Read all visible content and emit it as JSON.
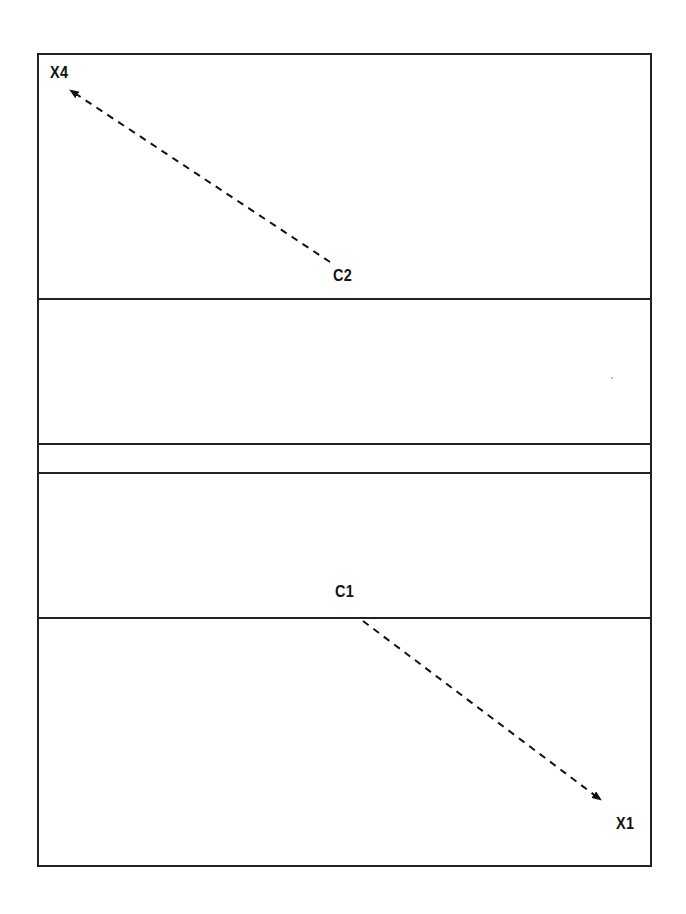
{
  "diagram": {
    "type": "field-layout",
    "colors": {
      "line": "#222222",
      "text": "#111111",
      "background": "#ffffff"
    },
    "zones": [
      {
        "id": "zone-top",
        "y_range": [
          53,
          299
        ]
      },
      {
        "id": "zone-upper-middle",
        "y_range": [
          299,
          444
        ]
      },
      {
        "id": "zone-band",
        "y_range": [
          444,
          473
        ]
      },
      {
        "id": "zone-lower-middle",
        "y_range": [
          473,
          618
        ]
      },
      {
        "id": "zone-bottom",
        "y_range": [
          618,
          865
        ]
      }
    ],
    "labels": {
      "x4": "X4",
      "c2": "C2",
      "c1": "C1",
      "x1": "X1"
    },
    "arrows": [
      {
        "from": "C2",
        "to": "X4",
        "style": "dashed"
      },
      {
        "from": "C1",
        "to": "X1",
        "style": "dashed"
      }
    ]
  }
}
